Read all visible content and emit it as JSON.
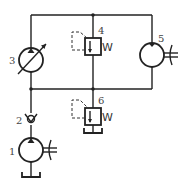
{
  "diagram": {
    "type": "hydraulic-circuit",
    "components": [
      {
        "id": "1",
        "label": "1",
        "kind": "hydraulic-pump-fixed"
      },
      {
        "id": "2",
        "label": "2",
        "kind": "check-valve"
      },
      {
        "id": "3",
        "label": "3",
        "kind": "variable-displacement-pump-motor"
      },
      {
        "id": "4",
        "label": "4",
        "kind": "pressure-valve-pilot-operated"
      },
      {
        "id": "5",
        "label": "5",
        "kind": "hydraulic-motor-fixed"
      },
      {
        "id": "6",
        "label": "6",
        "kind": "relief-valve-pilot-operated"
      }
    ],
    "spring_symbol": "W",
    "line_color": "#222222"
  }
}
